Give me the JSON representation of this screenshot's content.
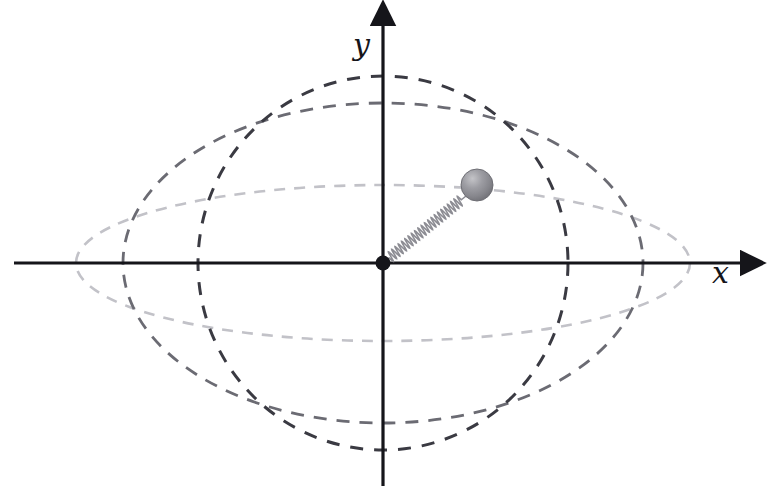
{
  "figure": {
    "background_color": "#ffffff",
    "width": 770,
    "height": 500
  },
  "axes": {
    "origin": {
      "x": 383,
      "y": 263
    },
    "color": "#15151a",
    "stroke_width": 3.2,
    "x_axis": {
      "label": "x",
      "label_position": {
        "x": 712,
        "y": 258
      },
      "start": {
        "x": 14,
        "y": 263
      },
      "end": {
        "x": 756,
        "y": 263
      },
      "arrow": "right"
    },
    "y_axis": {
      "label": "y",
      "label_position": {
        "x": 353,
        "y": 30
      },
      "start": {
        "x": 383,
        "y": 486
      },
      "end": {
        "x": 383,
        "y": 10
      },
      "arrow": "up"
    }
  },
  "origin_marker": {
    "name": "origin-point",
    "cx": 383,
    "cy": 263,
    "r": 7.5,
    "color": "#15151a"
  },
  "spring": {
    "name": "spring-coil",
    "from": {
      "x": 383,
      "y": 263
    },
    "to": {
      "x": 466,
      "y": 196
    },
    "coils": 22,
    "amplitude": 5.2,
    "color": "#8d8d94",
    "stroke_width": 1.6
  },
  "mass": {
    "name": "oscillating-mass",
    "cx": 477,
    "cy": 185,
    "r": 16,
    "fill_light": "#b9b9bd",
    "fill_mid": "#8e8e95",
    "fill_dark": "#757579",
    "stroke": "#6f6f75"
  },
  "chart_data": {
    "type": "scatter",
    "xlabel": "x",
    "ylabel": "y",
    "grid": false,
    "legend": "none",
    "xlim": [
      -307,
      307
    ],
    "ylim": [
      -187,
      187
    ],
    "center": [
      0,
      0
    ],
    "orbits": [
      {
        "name": "orbit-outer-wide",
        "shape": "ellipse",
        "semi_axis_x": 307,
        "semi_axis_y": 78,
        "color": "#c2c2c8",
        "dash": "11 9",
        "stroke_width": 2.6,
        "pixel_center": {
          "cx": 383,
          "cy": 263
        },
        "pixel_rx": 307,
        "pixel_ry": 78,
        "x_intercepts": [
          -307,
          307
        ],
        "y_intercepts": [
          -78,
          78
        ]
      },
      {
        "name": "orbit-middle",
        "shape": "ellipse",
        "semi_axis_x": 260,
        "semi_axis_y": 160,
        "color": "#6b6b73",
        "dash": "13 10",
        "stroke_width": 2.8,
        "pixel_center": {
          "cx": 383,
          "cy": 263
        },
        "pixel_rx": 260,
        "pixel_ry": 160,
        "x_intercepts": [
          -260,
          260
        ],
        "y_intercepts": [
          -160,
          160
        ]
      },
      {
        "name": "orbit-inner-tall",
        "shape": "ellipse",
        "semi_axis_x": 185,
        "semi_axis_y": 187,
        "color": "#3a3a42",
        "dash": "13 11",
        "stroke_width": 3.0,
        "pixel_center": {
          "cx": 383,
          "cy": 263
        },
        "pixel_rx": 185,
        "pixel_ry": 187,
        "x_intercepts": [
          -185,
          185
        ],
        "y_intercepts": [
          -187,
          187
        ]
      }
    ],
    "annotations": [
      {
        "name": "mass-position",
        "x": 94,
        "y": 78,
        "label": ""
      },
      {
        "name": "spring-anchor",
        "x": 0,
        "y": 0,
        "label": ""
      }
    ]
  }
}
